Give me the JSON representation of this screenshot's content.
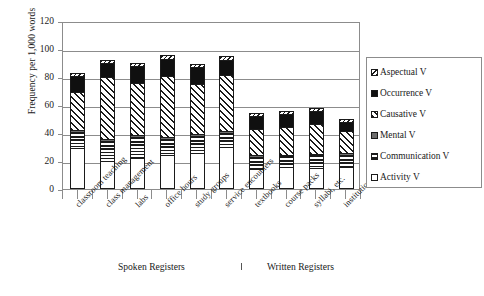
{
  "chart_data": {
    "type": "bar",
    "subtype": "stacked-bar",
    "title": "",
    "xlabel": "",
    "ylabel": "Frequency per 1,000 words",
    "ylim": [
      0,
      120
    ],
    "yticks": [
      0,
      20,
      40,
      60,
      80,
      100,
      120
    ],
    "grid": true,
    "legend_position": "right",
    "categories": [
      "classroom teaching",
      "class management",
      "labs",
      "office hours",
      "study groups",
      "service encounters",
      "textbooks",
      "course packs",
      "syllabi, etc.",
      "institutional writing"
    ],
    "category_groups": [
      {
        "label": "Spoken Registers",
        "categories": 6
      },
      {
        "label": "Written Registers",
        "categories": 4
      }
    ],
    "series": [
      {
        "name": "Activity V",
        "pattern": "open-white",
        "values": [
          29.0,
          20.0,
          22.0,
          24.0,
          26.0,
          30.0,
          14.0,
          16.0,
          15.0,
          16.0
        ]
      },
      {
        "name": "Communication V",
        "pattern": "horizontal-lines",
        "values": [
          12.0,
          14.5,
          15.0,
          11.5,
          12.0,
          10.0,
          9.0,
          7.5,
          9.0,
          8.5
        ]
      },
      {
        "name": "Mental V",
        "pattern": "solid-gray",
        "values": [
          1.5,
          1.5,
          1.5,
          1.5,
          1.5,
          1.5,
          1.0,
          1.0,
          1.0,
          1.0
        ]
      },
      {
        "name": "Causative V",
        "pattern": "diagonal-hatch",
        "values": [
          26.5,
          44.0,
          37.5,
          44.0,
          35.5,
          40.0,
          19.0,
          20.0,
          21.5,
          16.0
        ]
      },
      {
        "name": "Occurrence V",
        "pattern": "solid-black",
        "values": [
          12.0,
          10.0,
          12.0,
          12.0,
          12.0,
          11.0,
          9.0,
          9.0,
          9.0,
          6.5
        ]
      },
      {
        "name": "Aspectual V",
        "pattern": "fine-hatch",
        "values": [
          2.0,
          2.0,
          2.0,
          3.0,
          2.0,
          2.5,
          2.0,
          2.0,
          2.5,
          2.0
        ]
      }
    ],
    "totals": [
      83.0,
      92.0,
      90.0,
      96.0,
      89.0,
      95.0,
      54.0,
      55.5,
      58.0,
      50.0
    ]
  },
  "legend": {
    "items": [
      {
        "label": "Aspectual V"
      },
      {
        "label": "Occurrence V"
      },
      {
        "label": "Causative V"
      },
      {
        "label": "Mental V"
      },
      {
        "label": "Communication V"
      },
      {
        "label": "Activity V"
      }
    ]
  },
  "colors": {
    "ink": "#1a1a1a",
    "axis": "#8c8c8c",
    "gray_fill": "#6e6e6e",
    "black_fill": "#101010",
    "background": "#ffffff"
  }
}
